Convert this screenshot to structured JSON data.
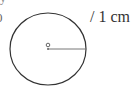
{
  "diagram": {
    "label": "/ 1 cm",
    "partial_number": "0",
    "top_partial": "y",
    "circle": {
      "cx": 48,
      "cy": 49,
      "rx": 38,
      "ry": 36,
      "stroke": "#333333"
    },
    "center_point": {
      "cx": 48,
      "cy": 45,
      "r": 1.8,
      "stroke": "#555555"
    },
    "radius_line": {
      "x1": 48,
      "y1": 49,
      "x2": 86,
      "y2": 49,
      "stroke": "#555555"
    }
  }
}
